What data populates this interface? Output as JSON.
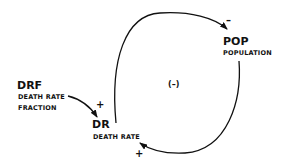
{
  "diagram": {
    "type": "causal-loop",
    "loop_polarity": "(–)",
    "nodes": {
      "pop": {
        "abbr": "POP",
        "name": "POPULATION"
      },
      "dr": {
        "abbr": "DR",
        "name": "DEATH RATE"
      },
      "drf": {
        "abbr": "DRF",
        "name1": "DEATH RATE",
        "name2": "FRACTION"
      }
    },
    "links": [
      {
        "from": "DRF",
        "to": "DR",
        "sign": "+"
      },
      {
        "from": "DR",
        "to": "POP",
        "sign": "–"
      },
      {
        "from": "POP",
        "to": "DR",
        "sign": "+"
      }
    ],
    "signs": {
      "drf_dr": "+",
      "dr_pop": "–",
      "pop_dr": "+"
    }
  }
}
